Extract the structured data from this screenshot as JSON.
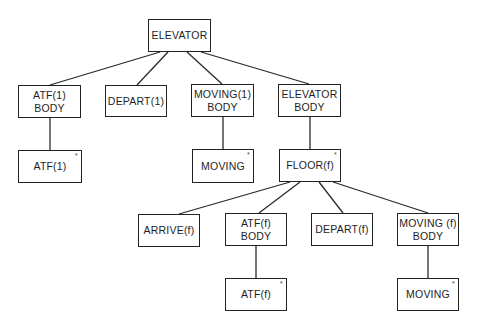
{
  "diagram": {
    "type": "tree",
    "nodes": [
      {
        "id": "elevator",
        "lines": [
          "ELEVATOR",
          ""
        ],
        "iteration": false,
        "box": [
          148,
          19,
          63,
          33
        ]
      },
      {
        "id": "atf1-body",
        "lines": [
          "ATF(1)",
          "BODY"
        ],
        "iteration": false,
        "box": [
          18,
          85,
          63,
          33
        ]
      },
      {
        "id": "depart1",
        "lines": [
          "DEPART(1)",
          ""
        ],
        "iteration": false,
        "box": [
          105,
          85,
          62,
          32
        ]
      },
      {
        "id": "moving1-body",
        "lines": [
          "MOVING(1)",
          "BODY"
        ],
        "iteration": false,
        "box": [
          191,
          84,
          63,
          33
        ]
      },
      {
        "id": "elevator-body",
        "lines": [
          "ELEVATOR",
          "BODY"
        ],
        "iteration": false,
        "box": [
          278,
          84,
          63,
          33
        ]
      },
      {
        "id": "atf1",
        "lines": [
          "ATF(1)",
          ""
        ],
        "iteration": true,
        "box": [
          18,
          150,
          64,
          33
        ]
      },
      {
        "id": "moving-a",
        "lines": [
          "MOVING",
          ""
        ],
        "iteration": true,
        "box": [
          192,
          149,
          62,
          34
        ]
      },
      {
        "id": "floor-f",
        "lines": [
          "FLOOR(f)",
          ""
        ],
        "iteration": true,
        "box": [
          279,
          149,
          62,
          33
        ]
      },
      {
        "id": "arrive-f",
        "lines": [
          "ARRIVE(f)",
          ""
        ],
        "iteration": false,
        "box": [
          138,
          214,
          62,
          33
        ]
      },
      {
        "id": "atff-body",
        "lines": [
          "ATF(f)",
          "BODY"
        ],
        "iteration": false,
        "box": [
          225,
          213,
          62,
          33
        ]
      },
      {
        "id": "depart-f",
        "lines": [
          "DEPART(f)",
          ""
        ],
        "iteration": false,
        "box": [
          311,
          213,
          62,
          33
        ]
      },
      {
        "id": "movingf-body",
        "lines": [
          "MOVING (f)",
          "BODY"
        ],
        "iteration": false,
        "box": [
          397,
          213,
          62,
          33
        ]
      },
      {
        "id": "atf-f",
        "lines": [
          "ATF(f)",
          ""
        ],
        "iteration": true,
        "box": [
          225,
          278,
          62,
          33
        ]
      },
      {
        "id": "moving-b",
        "lines": [
          "MOVING",
          ""
        ],
        "iteration": true,
        "box": [
          397,
          278,
          62,
          33
        ]
      }
    ],
    "edges": [
      [
        "elevator",
        "atf1-body"
      ],
      [
        "elevator",
        "depart1"
      ],
      [
        "elevator",
        "moving1-body"
      ],
      [
        "elevator",
        "elevator-body"
      ],
      [
        "atf1-body",
        "atf1"
      ],
      [
        "moving1-body",
        "moving-a"
      ],
      [
        "elevator-body",
        "floor-f"
      ],
      [
        "floor-f",
        "arrive-f"
      ],
      [
        "floor-f",
        "atff-body"
      ],
      [
        "floor-f",
        "depart-f"
      ],
      [
        "floor-f",
        "movingf-body"
      ],
      [
        "atff-body",
        "atf-f"
      ],
      [
        "movingf-body",
        "moving-b"
      ]
    ],
    "iteration_marker": "*"
  }
}
